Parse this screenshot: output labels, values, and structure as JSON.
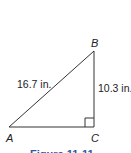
{
  "figure": {
    "vertices": {
      "A": "A",
      "B": "B",
      "C": "C"
    },
    "measurements": {
      "hypotenuse_AB": "16.7 in.",
      "leg_BC": "10.3 in."
    },
    "right_angle_at": "C",
    "caption": "Figure 11-11",
    "colors": {
      "lines": "#333333",
      "caption": "#2a5aa8"
    }
  }
}
